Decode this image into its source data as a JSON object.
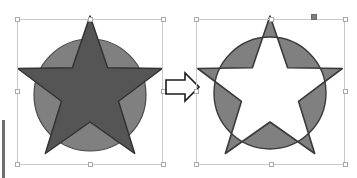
{
  "app": {
    "background_color": "#ffffff",
    "operation_name": "exclude-overlap"
  },
  "panel_edge": {
    "name": "left-panel-edge",
    "color": "#6e6e6e"
  },
  "left_object": {
    "label": "circle-and-star-overlapping",
    "circle": {
      "name": "circle-shape",
      "fill": "#808080",
      "stroke": "#4a4a4a",
      "cx": 90,
      "cy": 95,
      "r": 56
    },
    "star": {
      "name": "star-shape",
      "fill": "#555555",
      "stroke": "#3a3a3a",
      "cx": 90,
      "cy": 92,
      "outer_r": 76,
      "inner_r": 30,
      "points": 5
    },
    "selection": {
      "name": "selection-box-left",
      "x": 17,
      "y": 19,
      "width": 146,
      "height": 146,
      "border_color": "#c9c9cf",
      "handle_fill": "#ffffff",
      "handle_border": "#a9a9b0"
    }
  },
  "arrow": {
    "name": "result-arrow",
    "direction": "right",
    "fill": "#ffffff",
    "stroke": "#1c1c1c"
  },
  "right_object": {
    "label": "exclusive-or-result",
    "fill": "#808080",
    "stroke": "#3a3a3a",
    "hole_fill": "#ffffff",
    "circle": {
      "name": "result-circle",
      "cx": 270,
      "cy": 93,
      "r": 56
    },
    "star": {
      "name": "result-star",
      "cx": 270,
      "cy": 92,
      "outer_r": 76,
      "inner_r": 30,
      "points": 5
    },
    "selection": {
      "name": "selection-box-right",
      "x": 196,
      "y": 19,
      "width": 149,
      "height": 146,
      "border_color": "#c9c9cf",
      "handle_fill": "#ffffff",
      "handle_border": "#a9a9b0",
      "active_handle": {
        "name": "active-handle",
        "x": 311,
        "y": 14,
        "fill": "#7d7d85"
      }
    }
  }
}
